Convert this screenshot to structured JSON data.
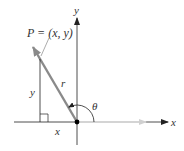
{
  "diagram": {
    "point_label": "P = (x, y)",
    "axis_x_label": "x",
    "axis_y_label": "y",
    "radius_label": "r",
    "angle_label": "θ",
    "leg_x_label": "x",
    "leg_y_label": "y",
    "colors": {
      "axis": "#222222",
      "vector_r": "#8a8a8a",
      "vector_x": "#cccccc",
      "origin_dot": "#000000"
    }
  }
}
